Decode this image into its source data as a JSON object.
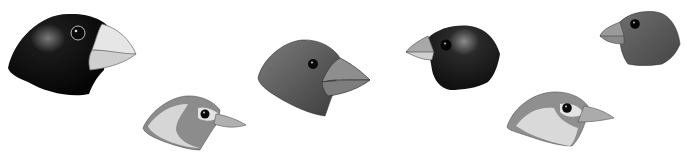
{
  "figure": {
    "background": "#ffffff",
    "birds": [
      {
        "id": "large-ground-finch",
        "body": "#0d0d0d",
        "beak": "#d8d8d8",
        "x": 8,
        "y": 14
      },
      {
        "id": "warbler-finch",
        "body": "#8a8a8a",
        "face": "#d9d9d9",
        "beak": "#a6a6a6",
        "x": 143,
        "y": 95
      },
      {
        "id": "medium-ground-finch",
        "body": "#5e5e5e",
        "beak": "#8c8c8c",
        "x": 258,
        "y": 40
      },
      {
        "id": "small-ground-finch",
        "body": "#1c1c1c",
        "beak": "#9a9a9a",
        "x": 405,
        "y": 24
      },
      {
        "id": "warbler-finch-2",
        "body": "#8f8f8f",
        "face": "#dcdcdc",
        "beak": "#a8a8a8",
        "x": 507,
        "y": 92
      },
      {
        "id": "tree-finch",
        "body": "#5a5a5a",
        "beak": "#8e8e8e",
        "x": 598,
        "y": 10
      }
    ]
  }
}
